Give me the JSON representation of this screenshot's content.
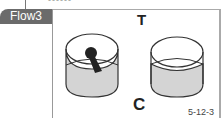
{
  "header": {
    "partial_text": "------",
    "tab_label": "Flow3"
  },
  "diagram": {
    "top_label": "T",
    "bottom_label": "C",
    "figure_number": "5-12-3",
    "cups": [
      {
        "name": "cup-with-dark-mass",
        "fill": "#d4d4d4",
        "has_mass": true
      },
      {
        "name": "empty-cup",
        "fill": "#d4d4d4",
        "has_mass": false
      }
    ],
    "colors": {
      "tab_bg": "#6b6b6b",
      "liquid": "#d4d4d4",
      "mass": "#222222",
      "outline": "#333333"
    }
  }
}
